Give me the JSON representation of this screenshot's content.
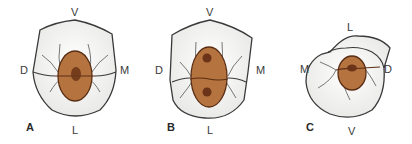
{
  "figure": {
    "panels": [
      {
        "id": "A",
        "label": "A",
        "orientation": {
          "top": "V",
          "bottom": "L",
          "left": "D",
          "right": "M"
        },
        "cavity": {
          "lesions": 1
        }
      },
      {
        "id": "B",
        "label": "B",
        "orientation": {
          "top": "V",
          "bottom": "L",
          "left": "D",
          "right": "M"
        },
        "cavity": {
          "lesions": 2
        }
      },
      {
        "id": "C",
        "label": "C",
        "orientation": {
          "top": "L",
          "bottom": "V",
          "left": "M",
          "right": "D"
        },
        "cavity": {
          "lesions": 1
        }
      }
    ],
    "colors": {
      "tooth_fill": "#f4f4f2",
      "tooth_outline": "#3a3a3a",
      "cavity_fill": "#b5733f",
      "cavity_outline": "#5a2e14",
      "lesion_fill": "#6b3418"
    }
  }
}
